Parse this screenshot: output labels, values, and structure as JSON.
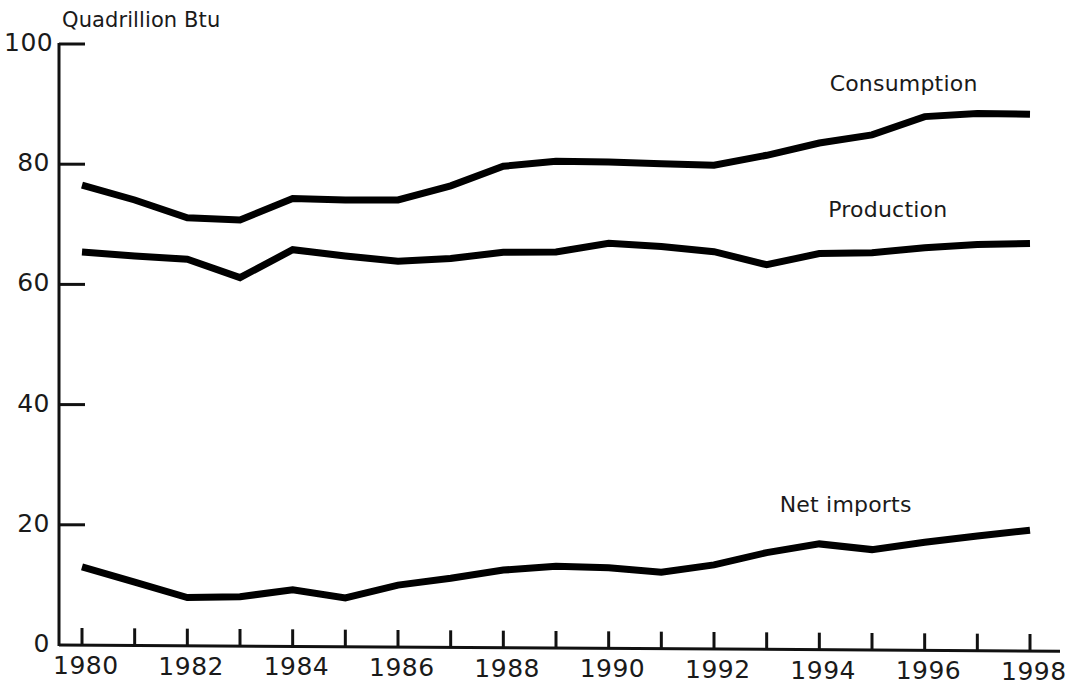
{
  "chart_data": {
    "type": "line",
    "title": "",
    "ylabel": "Quadrillion Btu",
    "xlabel": "",
    "ylim": [
      0,
      100
    ],
    "xlim": [
      1980,
      1998
    ],
    "y_ticks": [
      0,
      20,
      40,
      60,
      80,
      100
    ],
    "y_tick_labels": [
      "0",
      "20",
      "40",
      "60",
      "80",
      "100"
    ],
    "x_ticks": [
      1980,
      1981,
      1982,
      1983,
      1984,
      1985,
      1986,
      1987,
      1988,
      1989,
      1990,
      1991,
      1992,
      1993,
      1994,
      1995,
      1996,
      1997,
      1998
    ],
    "x_tick_labels": [
      "1980",
      "1982",
      "1984",
      "1986",
      "1988",
      "1990",
      "1992",
      "1994",
      "1996",
      "1998"
    ],
    "x_labeled_ticks": [
      1980,
      1982,
      1984,
      1986,
      1988,
      1990,
      1992,
      1994,
      1996,
      1998
    ],
    "grid": false,
    "legend_position": "inline-right",
    "line_color": "#000000",
    "line_width": 7,
    "x": [
      1980,
      1981,
      1982,
      1983,
      1984,
      1985,
      1986,
      1987,
      1988,
      1989,
      1990,
      1991,
      1992,
      1993,
      1994,
      1995,
      1996,
      1997,
      1998
    ],
    "series": [
      {
        "name": "Consumption",
        "label_anchor_year": 1995.6,
        "label_anchor_value": 95.5,
        "values": [
          76.5,
          74.1,
          71.2,
          70.9,
          74.5,
          74.3,
          74.4,
          76.8,
          80.1,
          81.0,
          80.9,
          80.7,
          80.5,
          82.2,
          84.3,
          85.7,
          88.8,
          89.4,
          89.3
        ]
      },
      {
        "name": "Production",
        "label_anchor_year": 1995.3,
        "label_anchor_value": 74.5,
        "values": [
          65.4,
          64.8,
          64.3,
          61.3,
          66.0,
          65.0,
          64.2,
          64.7,
          65.8,
          65.9,
          67.4,
          66.9,
          66.1,
          64.0,
          65.9,
          66.1,
          67.0,
          67.6,
          67.8
        ]
      },
      {
        "name": "Net imports",
        "label_anchor_year": 1994.5,
        "label_anchor_value": 25.5,
        "values": [
          13.0,
          10.5,
          8.0,
          8.2,
          9.4,
          8.1,
          10.3,
          11.5,
          12.9,
          13.6,
          13.4,
          12.7,
          14.0,
          16.1,
          17.6,
          16.7,
          18.0,
          19.1,
          20.1
        ]
      }
    ]
  }
}
